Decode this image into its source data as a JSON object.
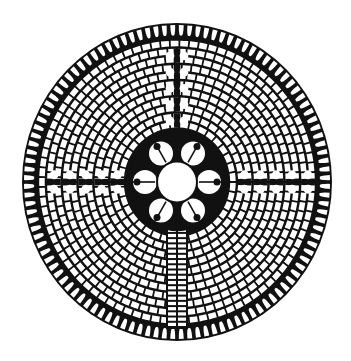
{
  "figure": {
    "ring_count": 11,
    "petal_count": 6,
    "lunation_count": 112,
    "colors": {
      "ink": "#111111",
      "paper": "#ffffff"
    }
  }
}
